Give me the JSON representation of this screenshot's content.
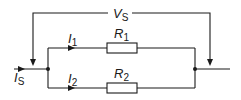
{
  "diagram": {
    "type": "parallel-resistor-circuit",
    "voltage": {
      "symbol": "V",
      "subscript": "S"
    },
    "source_current": {
      "symbol": "I",
      "subscript": "S"
    },
    "branches": [
      {
        "current": {
          "symbol": "I",
          "subscript": "1"
        },
        "resistor": {
          "symbol": "R",
          "subscript": "1"
        }
      },
      {
        "current": {
          "symbol": "I",
          "subscript": "2"
        },
        "resistor": {
          "symbol": "R",
          "subscript": "2"
        }
      }
    ],
    "colors": {
      "line": "#1a1a1a",
      "background": "#ffffff"
    }
  }
}
